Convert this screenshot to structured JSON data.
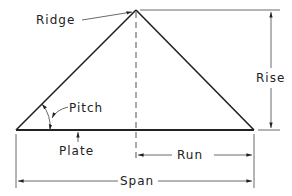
{
  "diagram": {
    "labels": {
      "ridge": "Ridge",
      "rise": "Rise",
      "pitch": "Pitch",
      "plate": "Plate",
      "run": "Run",
      "span": "Span"
    },
    "colors": {
      "line": "#222222",
      "background": "#ffffff"
    }
  }
}
